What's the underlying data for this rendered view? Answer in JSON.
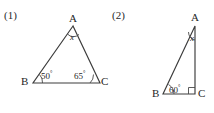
{
  "figures": [
    {
      "number": "(1)",
      "type": "triangle",
      "vertices": {
        "a": "A",
        "b": "B",
        "c": "C"
      },
      "angles": {
        "at_a": {
          "value": "x",
          "unknown": true
        },
        "at_b": {
          "value": "50",
          "degree_symbol": "°"
        },
        "at_c": {
          "value": "65",
          "degree_symbol": "°"
        }
      },
      "geometry": {
        "points": {
          "a": [
            73,
            26
          ],
          "b": [
            33,
            83
          ],
          "c": [
            100,
            83
          ]
        },
        "path": "M 73 26 L 33 83 L 100 83 Z",
        "arc_at_a": "M 67.5 34 A 8 8 0 0 0 79 34.5",
        "arc_at_b": "M 42.5 83 A 11 11 0 0 0 39.5 74.5",
        "arc_at_c": "M 90 83 A 11 11 0 0 0 93.5 74.5"
      }
    },
    {
      "number": "(2)",
      "type": "right-triangle",
      "vertices": {
        "a": "A",
        "b": "B",
        "c": "C"
      },
      "angles": {
        "at_a": {
          "value": "x",
          "unknown": true
        },
        "at_b": {
          "value": "60",
          "degree_symbol": "°"
        },
        "at_c": {
          "value": "90",
          "right_angle_mark": true
        }
      },
      "geometry": {
        "points": {
          "a": [
            88,
            26
          ],
          "b": [
            56,
            94
          ],
          "c": [
            88,
            94
          ]
        },
        "path": "M 88 26 L 56 94 L 88 94 Z",
        "arc_at_a": "M 81.5 32 A 8.5 8.5 0 0 0 88 40",
        "arc_at_b": "M 67 94 A 11.5 11.5 0 0 0 61.5 84.5",
        "right_angle_path": "M 81.5 94 L 81.5 87.5 L 88 87.5"
      }
    }
  ],
  "colors": {
    "background": "#ffffff",
    "stroke": "#3c3c3c",
    "arc_stroke": "#4a4a4a",
    "text": "#1f1f1f"
  }
}
